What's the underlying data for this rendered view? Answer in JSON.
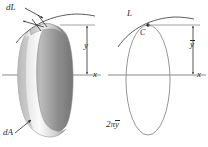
{
  "figure": {
    "caption_present": false,
    "background_color": "#ffffff",
    "ink_color": "#2b2b2b",
    "axis_color": "#8a8a8a",
    "band_light": "#f2f2f2",
    "band_mid": "#c9c9c9",
    "band_dark": "#9a9a9a",
    "panels": [
      {
        "id": "left",
        "description": "differential element of a line revolved about the x axis generating a band of area dA",
        "labels": {
          "element_length": "dL",
          "element_area": "dA",
          "radius": "y",
          "axis": "x"
        }
      },
      {
        "id": "right",
        "description": "whole line L of length L with centroid C at distance y-bar from the x axis, generating a surface of revolution",
        "labels": {
          "curve": "L",
          "centroid": "C",
          "centroid_distance": "y",
          "centroid_distance_overbar": true,
          "axis": "x",
          "revolved_path_length_prefix": "2π",
          "revolved_path_length_var": "y",
          "revolved_path_length_overbar": true
        }
      }
    ]
  }
}
